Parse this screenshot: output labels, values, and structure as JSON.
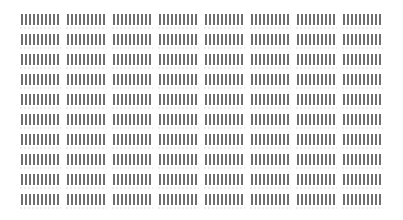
{
  "grid": {
    "columns": 8,
    "rows": 10,
    "bars_per_cell": 10,
    "bar_color": "#6f6f6f",
    "background": "#ffffff",
    "cell_content": "redacted-barcode"
  }
}
